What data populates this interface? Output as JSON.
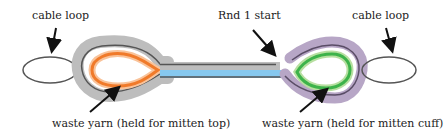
{
  "labels": {
    "cable_loop_left": "cable loop",
    "cable_loop_right": "cable loop",
    "rnd1_start": "Rnd 1 start",
    "waste_yarn_top": "waste yarn (held for mitten top)",
    "waste_yarn_cuff": "waste yarn (held for mitten cuff)"
  },
  "colors": {
    "cable": "#555555",
    "gray_band": "#b8b8b8",
    "orange": "#f07a2a",
    "orange_light": "#f9c39a",
    "green": "#3db34a",
    "green_light": "#b7dfa0",
    "purple": "#9e8aae",
    "blue": "#7ec4ee",
    "arrow": "#111111"
  }
}
